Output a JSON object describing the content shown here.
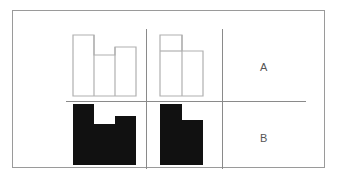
{
  "figure": {
    "background_color": "#ffffff",
    "frame_color": "#9a9a9a",
    "divider_color": "#8a8a8a",
    "outline_color": "#b0b0b0",
    "fill_color": "#111111",
    "label_color": "#555555"
  },
  "rows": [
    {
      "id": "row-a",
      "label": "A",
      "style": "outline",
      "shapes": [
        {
          "id": "shape-a1",
          "name": "castle-outline-shape",
          "description": "U-shaped / castellated outline: tall left bar, short middle bar, medium right bar",
          "bars": [
            {
              "name": "left-bar",
              "width": 22,
              "height": 61
            },
            {
              "name": "middle-bar",
              "width": 21,
              "height": 40
            },
            {
              "name": "right-bar",
              "width": 21,
              "height": 48
            }
          ],
          "total_width": 64,
          "total_height": 61
        },
        {
          "id": "shape-a2",
          "name": "flag-outline-shape",
          "description": "L-shaped outline: tall left bar and shorter right bar",
          "bars": [
            {
              "name": "left-bar",
              "width": 22,
              "height": 61
            },
            {
              "name": "right-bar",
              "width": 22,
              "height": 45
            }
          ],
          "total_width": 44,
          "total_height": 61
        }
      ]
    },
    {
      "id": "row-b",
      "label": "B",
      "style": "filled",
      "shapes": [
        {
          "id": "shape-b1",
          "name": "castle-filled-shape",
          "description": "U-shaped / castellated solid black figure: tall left bar, short middle bar, medium right bar",
          "bars": [
            {
              "name": "left-bar",
              "width": 22,
              "height": 61
            },
            {
              "name": "middle-bar",
              "width": 21,
              "height": 40
            },
            {
              "name": "right-bar",
              "width": 21,
              "height": 48
            }
          ],
          "total_width": 64,
          "total_height": 61
        },
        {
          "id": "shape-b2",
          "name": "flag-filled-shape",
          "description": "L-shaped solid black figure: tall left bar and shorter right bar",
          "bars": [
            {
              "name": "left-bar",
              "width": 22,
              "height": 61
            },
            {
              "name": "right-bar",
              "width": 22,
              "height": 45
            }
          ],
          "total_width": 44,
          "total_height": 61
        }
      ]
    }
  ],
  "dividers": {
    "vertical": [
      {
        "name": "column-divider-1",
        "x": 133
      },
      {
        "name": "column-divider-2",
        "x": 209
      }
    ],
    "horizontal": [
      {
        "name": "row-divider",
        "y": 90
      }
    ]
  }
}
